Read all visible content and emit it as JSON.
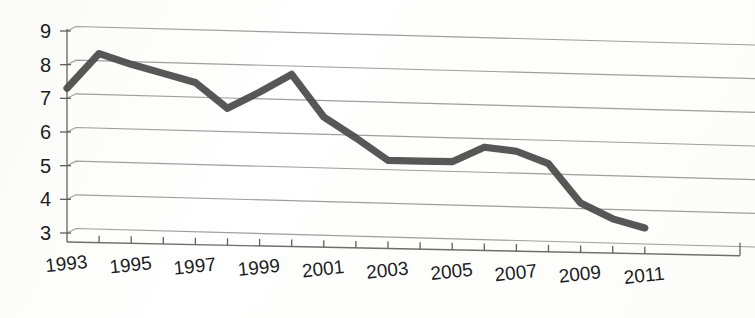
{
  "chart_data": {
    "type": "line",
    "title": "",
    "subtitle": "",
    "xlabel": "",
    "ylabel": "",
    "grid": true,
    "legend": null,
    "style": "3d-perspective-line",
    "xlim": [
      1993,
      2011
    ],
    "ylim": [
      3,
      9
    ],
    "y_ticks": [
      3,
      4,
      5,
      6,
      7,
      8,
      9
    ],
    "y_tick_labels": [
      "3",
      "4",
      "5",
      "6",
      "7",
      "8",
      "9"
    ],
    "x_ticks": [
      1993,
      1994,
      1995,
      1996,
      1997,
      1998,
      1999,
      2000,
      2001,
      2002,
      2003,
      2004,
      2005,
      2006,
      2007,
      2008,
      2009,
      2010,
      2011
    ],
    "x_tick_labels": [
      "1993",
      "",
      "1995",
      "",
      "1997",
      "",
      "1999",
      "",
      "2001",
      "",
      "2003",
      "",
      "2005",
      "",
      "2007",
      "",
      "2009",
      "",
      "2011"
    ],
    "x_labels_shown": [
      "1993",
      "1995",
      "1997",
      "1999",
      "2001",
      "2003",
      "2005",
      "2007",
      "2009",
      "2011"
    ],
    "categories": [
      1993,
      1994,
      1995,
      1996,
      1997,
      1998,
      1999,
      2000,
      2001,
      2002,
      2003,
      2004,
      2005,
      2006,
      2007,
      2008,
      2009,
      2010,
      2011
    ],
    "values": [
      7.3,
      8.35,
      8.05,
      7.8,
      7.55,
      6.8,
      7.3,
      7.85,
      6.6,
      6.0,
      5.35,
      5.35,
      5.35,
      5.8,
      5.7,
      5.35,
      4.2,
      3.75,
      3.5
    ],
    "series": [
      {
        "name": "series-1",
        "color": "#4a4a4a",
        "values": [
          7.3,
          8.35,
          8.05,
          7.8,
          7.55,
          6.8,
          7.3,
          7.85,
          6.6,
          6.0,
          5.35,
          5.35,
          5.35,
          5.8,
          5.7,
          5.35,
          4.2,
          3.75,
          3.5
        ]
      }
    ],
    "annotations": []
  },
  "colors": {
    "line": "#4a4a4a",
    "grid": "#8d8d8d",
    "axis": "#6e6e6e",
    "text": "#1c1c1c",
    "background": "#ffffff"
  }
}
